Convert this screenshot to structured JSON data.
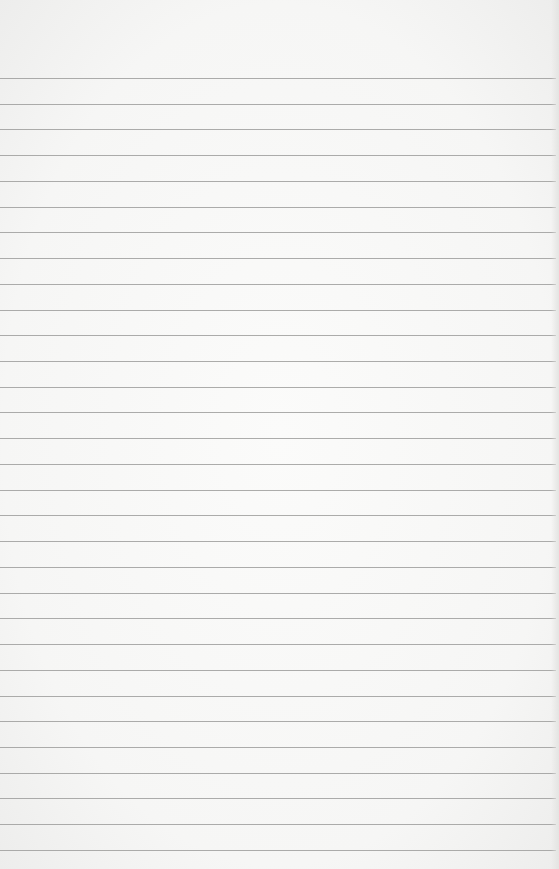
{
  "page": {
    "type": "lined-paper",
    "background_color": "#f7f7f6",
    "line_color": "#9e9e9c",
    "line_count": 31,
    "first_line_y": 78,
    "line_spacing": 25.73
  }
}
